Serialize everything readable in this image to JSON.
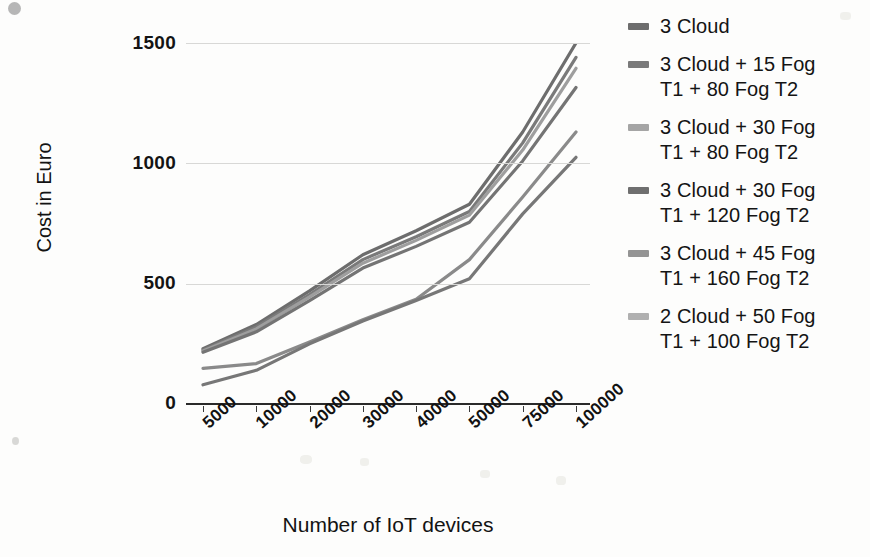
{
  "figure": {
    "background": "#fdfdfc"
  },
  "chart_data": {
    "type": "line",
    "title": "",
    "xlabel": "Number of IoT devices",
    "ylabel": "Cost in Euro",
    "categories": [
      "5000",
      "10000",
      "20000",
      "30000",
      "40000",
      "50000",
      "75000",
      "100000"
    ],
    "ylim": [
      0,
      1500
    ],
    "yticks": [
      0,
      500,
      1000,
      1500
    ],
    "ytick_labels": [
      "0",
      "500",
      "1000",
      "1500"
    ],
    "grid": true,
    "legend_position": "right",
    "series": [
      {
        "name": "3 Cloud",
        "color": "#6d6d6d",
        "values": [
          230,
          330,
          470,
          620,
          720,
          830,
          1130,
          1500
        ]
      },
      {
        "name": "3 Cloud  + 15 Fog T1 + 80 Fog T2",
        "color": "#7a7a7a",
        "values": [
          225,
          320,
          455,
          600,
          695,
          800,
          1085,
          1440
        ]
      },
      {
        "name": "3 Cloud + 30 Fog T1 + 80 Fog T2",
        "color": "#9e9e9e",
        "values": [
          220,
          312,
          445,
          585,
          680,
          785,
          1055,
          1395
        ]
      },
      {
        "name": "3 Cloud + 30 Fog T1 + 120 Fog T2",
        "color": "#747474",
        "values": [
          215,
          300,
          430,
          565,
          655,
          755,
          1010,
          1315
        ]
      },
      {
        "name": "3 Cloud + 45 Fog T1 + 160 Fog T2",
        "color": "#8a8a8a",
        "values": [
          148,
          168,
          258,
          350,
          435,
          600,
          860,
          1130
        ]
      },
      {
        "name": "2 Cloud + 50 Fog T1 + 100 Fog T2",
        "color": "#777777",
        "values": [
          80,
          140,
          250,
          345,
          430,
          520,
          790,
          1025
        ]
      }
    ]
  },
  "legend": {
    "entries": [
      {
        "label": "3 Cloud",
        "lines": [
          "3 Cloud"
        ],
        "color": "#6d6d6d"
      },
      {
        "label": "3 Cloud  + 15 Fog T1 + 80 Fog T2",
        "lines": [
          "3 Cloud  + 15 Fog",
          "T1 + 80 Fog T2"
        ],
        "color": "#7a7a7a"
      },
      {
        "label": "3 Cloud + 30 Fog T1 + 80 Fog T2",
        "lines": [
          "3 Cloud + 30 Fog",
          "T1 + 80 Fog T2"
        ],
        "color": "#a5a5a5"
      },
      {
        "label": "3 Cloud + 30 Fog T1 + 120 Fog T2",
        "lines": [
          "3 Cloud + 30 Fog",
          "T1 + 120 Fog T2"
        ],
        "color": "#6f6f6f"
      },
      {
        "label": "3 Cloud + 45 Fog T1 + 160 Fog T2",
        "lines": [
          "3 Cloud + 45 Fog",
          "T1 + 160 Fog T2"
        ],
        "color": "#949494"
      },
      {
        "label": "2 Cloud + 50 Fog T1 + 100 Fog T2",
        "lines": [
          "2 Cloud + 50 Fog",
          "T1 + 100 Fog T2"
        ],
        "color": "#b0b0b0"
      }
    ]
  }
}
